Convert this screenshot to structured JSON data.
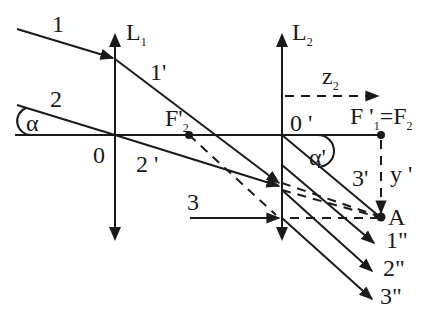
{
  "figure": {
    "type": "two-lens optical ray diagram",
    "colors": {
      "ink": "#1a1a1a",
      "background": "#ffffff"
    }
  },
  "lenses": [
    {
      "id": "L1",
      "label": "L",
      "sub": "1",
      "type": "converging"
    },
    {
      "id": "L2",
      "label": "L",
      "sub": "2",
      "type": "converging"
    }
  ],
  "points": {
    "origin1": "0",
    "origin2": "0 '",
    "f2_prime": {
      "main": "F'",
      "sub": "2"
    },
    "f1_eq_f2": {
      "main": "F '",
      "sub1": "1",
      "eq": "=F",
      "sub2": "2"
    },
    "image_point": "A"
  },
  "rays": {
    "incident": [
      "1",
      "2",
      "3"
    ],
    "between_lenses": [
      "1'",
      "2 '",
      "3'"
    ],
    "emergent": [
      "1\"",
      "2\"",
      "3\""
    ]
  },
  "angles": {
    "alpha": "α",
    "alpha_prime": "α'"
  },
  "dimensions": {
    "z2": {
      "main": "z",
      "sub": "2"
    },
    "y_prime": "y '"
  }
}
